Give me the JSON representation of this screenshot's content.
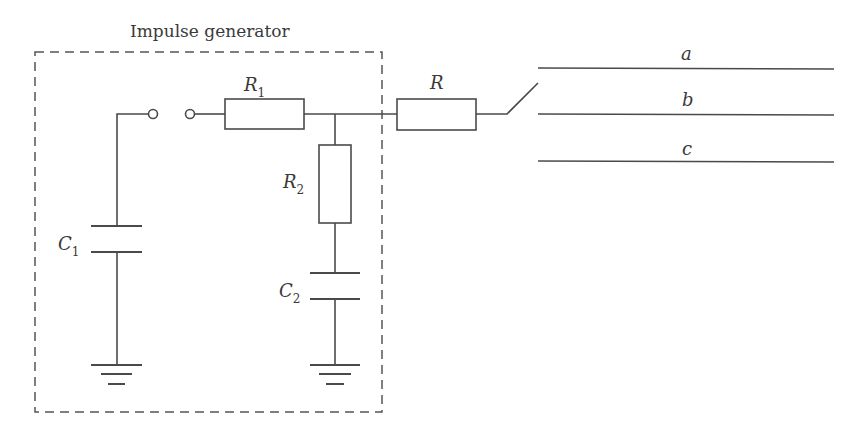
{
  "diagram": {
    "title": "Impulse generator",
    "components": {
      "r1": {
        "label": "R",
        "subscript": "1"
      },
      "r2": {
        "label": "R",
        "subscript": "2"
      },
      "r": {
        "label": "R"
      },
      "c1": {
        "label": "C",
        "subscript": "1"
      },
      "c2": {
        "label": "C",
        "subscript": "2"
      }
    },
    "lines": [
      {
        "label": "a"
      },
      {
        "label": "b"
      },
      {
        "label": "c"
      }
    ]
  }
}
